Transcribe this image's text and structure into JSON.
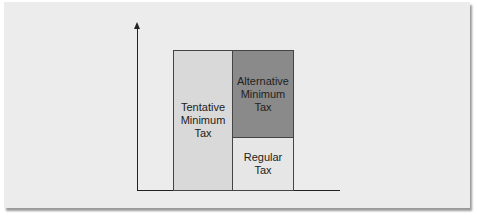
{
  "diagram": {
    "type": "stacked-bar-comparison",
    "boxes": [
      {
        "id": "tentative",
        "label": "Tentative\nMinimum\nTax",
        "color": "#d9d9d9"
      },
      {
        "id": "amt",
        "label": "Alternative\nMinimum\nTax",
        "color": "#8a8a8a"
      },
      {
        "id": "regular",
        "label": "Regular\nTax",
        "color": "#e6e6e6"
      }
    ],
    "relation": "Tentative Minimum Tax = Regular Tax + Alternative Minimum Tax"
  }
}
